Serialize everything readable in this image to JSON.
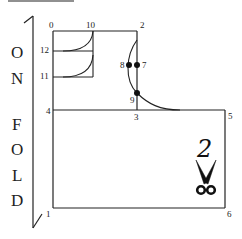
{
  "diagram": {
    "fold_letters": [
      "O",
      "N",
      "F",
      "O",
      "L",
      "D"
    ],
    "points": {
      "p0": "0",
      "p1": "1",
      "p2": "2",
      "p3": "3",
      "p4": "4",
      "p5": "5",
      "p6": "6",
      "p7": "7",
      "p8": "8",
      "p9": "9",
      "p10": "10",
      "p11": "11",
      "p12": "12"
    },
    "piece_number": "2",
    "scissors_icon": "scissors-icon",
    "line_color": "#222222"
  }
}
